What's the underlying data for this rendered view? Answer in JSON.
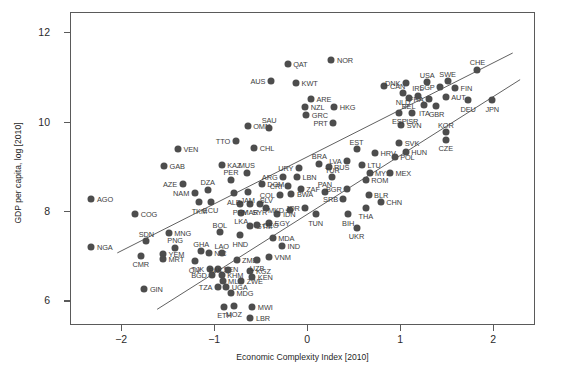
{
  "chart_data": {
    "type": "scatter",
    "title": "",
    "xlabel": "Economic Complexity Index [2010]",
    "ylabel": "GDP per capita, log [2010]",
    "xlim": [
      -2.55,
      2.45
    ],
    "ylim": [
      5.45,
      12.45
    ],
    "xticks": [
      -2,
      -1,
      0,
      1,
      2
    ],
    "xticklabels": [
      "−2",
      "−1",
      "0",
      "1",
      "2"
    ],
    "yticks": [
      6,
      8,
      10,
      12
    ],
    "yticklabels": [
      "6",
      "8",
      "10",
      "12"
    ],
    "grid": false,
    "legend": null,
    "marker_color": "#4d4d4d",
    "line_color": "#4d4d4d",
    "frame_color": "#5a5a5a",
    "trend_lines": [
      {
        "name": "upper-fit",
        "x1": -2.05,
        "y1": 7.05,
        "x2": 2.22,
        "y2": 11.55
      },
      {
        "name": "lower-fit",
        "x1": -1.62,
        "y1": 5.78,
        "x2": 2.3,
        "y2": 10.95
      }
    ],
    "points": [
      {
        "code": "AGO",
        "x": -2.33,
        "y": 8.28,
        "lp": "right"
      },
      {
        "code": "NGA",
        "x": -2.33,
        "y": 7.22,
        "lp": "right"
      },
      {
        "code": "COG",
        "x": -1.86,
        "y": 7.95,
        "lp": "right"
      },
      {
        "code": "SDN",
        "x": -1.74,
        "y": 7.35,
        "lp": "above"
      },
      {
        "code": "CMR",
        "x": -1.8,
        "y": 7.02,
        "lp": "below"
      },
      {
        "code": "GIN",
        "x": -1.76,
        "y": 6.28,
        "lp": "right"
      },
      {
        "code": "YEM",
        "x": -1.56,
        "y": 7.05,
        "lp": "right"
      },
      {
        "code": "MRT",
        "x": -1.56,
        "y": 6.95,
        "lp": "right"
      },
      {
        "code": "MNG",
        "x": -1.5,
        "y": 7.52,
        "lp": "right"
      },
      {
        "code": "PNG",
        "x": -1.43,
        "y": 7.2,
        "lp": "above"
      },
      {
        "code": "GAB",
        "x": -1.55,
        "y": 9.02,
        "lp": "right"
      },
      {
        "code": "VEN",
        "x": -1.4,
        "y": 9.4,
        "lp": "right"
      },
      {
        "code": "AZE",
        "x": -1.35,
        "y": 8.62,
        "lp": "left"
      },
      {
        "code": "NAM",
        "x": -1.22,
        "y": 8.42,
        "lp": "left"
      },
      {
        "code": "TKM",
        "x": -1.17,
        "y": 8.22,
        "lp": "below"
      },
      {
        "code": "ECU",
        "x": -1.05,
        "y": 8.23,
        "lp": "below"
      },
      {
        "code": "CIV",
        "x": -1.22,
        "y": 6.9,
        "lp": "below"
      },
      {
        "code": "GHA",
        "x": -1.15,
        "y": 7.12,
        "lp": "above"
      },
      {
        "code": "NIC",
        "x": -1.07,
        "y": 7.08,
        "lp": "right"
      },
      {
        "code": "BOL",
        "x": -0.95,
        "y": 7.55,
        "lp": "above"
      },
      {
        "code": "LAO",
        "x": -0.93,
        "y": 7.08,
        "lp": "above"
      },
      {
        "code": "TJK",
        "x": -1.06,
        "y": 6.72,
        "lp": "left"
      },
      {
        "code": "SEN",
        "x": -0.97,
        "y": 6.72,
        "lp": "right"
      },
      {
        "code": "BGD",
        "x": -1.03,
        "y": 6.58,
        "lp": "left"
      },
      {
        "code": "KHM",
        "x": -0.93,
        "y": 6.58,
        "lp": "right"
      },
      {
        "code": "PAK",
        "x": -0.86,
        "y": 6.7,
        "lp": "left"
      },
      {
        "code": "MLI",
        "x": -0.92,
        "y": 6.45,
        "lp": "right"
      },
      {
        "code": "TZA",
        "x": -0.97,
        "y": 6.33,
        "lp": "left"
      },
      {
        "code": "UGA",
        "x": -0.88,
        "y": 6.32,
        "lp": "right"
      },
      {
        "code": "MDG",
        "x": -0.83,
        "y": 6.18,
        "lp": "right"
      },
      {
        "code": "ETH",
        "x": -0.9,
        "y": 5.88,
        "lp": "below"
      },
      {
        "code": "MOZ",
        "x": -0.8,
        "y": 5.9,
        "lp": "below"
      },
      {
        "code": "MWI",
        "x": -0.6,
        "y": 5.88,
        "lp": "right"
      },
      {
        "code": "LBR",
        "x": -0.62,
        "y": 5.62,
        "lp": "right"
      },
      {
        "code": "ZWE",
        "x": -0.72,
        "y": 6.45,
        "lp": "right"
      },
      {
        "code": "ZMB",
        "x": -0.77,
        "y": 6.92,
        "lp": "right"
      },
      {
        "code": "KGZ",
        "x": -0.62,
        "y": 6.68,
        "lp": "right"
      },
      {
        "code": "KEN",
        "x": -0.6,
        "y": 6.55,
        "lp": "right"
      },
      {
        "code": "UZB",
        "x": -0.55,
        "y": 6.93,
        "lp": "below"
      },
      {
        "code": "VNM",
        "x": -0.42,
        "y": 7.0,
        "lp": "right"
      },
      {
        "code": "MDA",
        "x": -0.38,
        "y": 7.42,
        "lp": "right"
      },
      {
        "code": "IND",
        "x": -0.28,
        "y": 7.25,
        "lp": "right"
      },
      {
        "code": "EGY",
        "x": -0.42,
        "y": 7.75,
        "lp": "right"
      },
      {
        "code": "GTM",
        "x": -0.62,
        "y": 7.68,
        "lp": "right"
      },
      {
        "code": "GEO",
        "x": -0.55,
        "y": 7.7,
        "lp": "right"
      },
      {
        "code": "HND",
        "x": -0.73,
        "y": 7.48,
        "lp": "below"
      },
      {
        "code": "LKA",
        "x": -0.72,
        "y": 7.98,
        "lp": "below"
      },
      {
        "code": "PRY",
        "x": -0.73,
        "y": 8.18,
        "lp": "below"
      },
      {
        "code": "MAR",
        "x": -0.62,
        "y": 8.18,
        "lp": "below"
      },
      {
        "code": "SYR",
        "x": -0.52,
        "y": 8.18,
        "lp": "below"
      },
      {
        "code": "ALB",
        "x": -0.8,
        "y": 8.42,
        "lp": "below"
      },
      {
        "code": "JAM",
        "x": -0.65,
        "y": 8.45,
        "lp": "below"
      },
      {
        "code": "DZA",
        "x": -1.08,
        "y": 8.5,
        "lp": "above"
      },
      {
        "code": "PER",
        "x": -0.83,
        "y": 8.72,
        "lp": "above"
      },
      {
        "code": "MUS",
        "x": -0.66,
        "y": 8.88,
        "lp": "above"
      },
      {
        "code": "DOM",
        "x": -0.5,
        "y": 8.62,
        "lp": "right"
      },
      {
        "code": "KAZ",
        "x": -0.93,
        "y": 9.05,
        "lp": "right"
      },
      {
        "code": "TTO",
        "x": -0.78,
        "y": 9.58,
        "lp": "left"
      },
      {
        "code": "CHL",
        "x": -0.58,
        "y": 9.42,
        "lp": "right"
      },
      {
        "code": "OMN",
        "x": -0.65,
        "y": 9.92,
        "lp": "right"
      },
      {
        "code": "SAU",
        "x": -0.42,
        "y": 9.88,
        "lp": "above"
      },
      {
        "code": "AUS",
        "x": -0.4,
        "y": 10.92,
        "lp": "left"
      },
      {
        "code": "QAT",
        "x": -0.22,
        "y": 11.32,
        "lp": "right"
      },
      {
        "code": "KWT",
        "x": -0.13,
        "y": 10.88,
        "lp": "right"
      },
      {
        "code": "ARE",
        "x": 0.03,
        "y": 10.52,
        "lp": "right"
      },
      {
        "code": "NZL",
        "x": -0.03,
        "y": 10.35,
        "lp": "right"
      },
      {
        "code": "GRC",
        "x": -0.02,
        "y": 10.18,
        "lp": "right"
      },
      {
        "code": "HKG",
        "x": 0.28,
        "y": 10.35,
        "lp": "right"
      },
      {
        "code": "NOR",
        "x": 0.25,
        "y": 11.4,
        "lp": "right"
      },
      {
        "code": "PRT",
        "x": 0.27,
        "y": 9.98,
        "lp": "left"
      },
      {
        "code": "SLV",
        "x": -0.45,
        "y": 8.1,
        "lp": "above"
      },
      {
        "code": "IDN",
        "x": -0.33,
        "y": 7.95,
        "lp": "right"
      },
      {
        "code": "MKD",
        "x": -0.2,
        "y": 8.05,
        "lp": "left"
      },
      {
        "code": "JOR",
        "x": -0.03,
        "y": 8.08,
        "lp": "left"
      },
      {
        "code": "TUN",
        "x": 0.08,
        "y": 7.95,
        "lp": "below"
      },
      {
        "code": "COL",
        "x": -0.3,
        "y": 8.38,
        "lp": "left"
      },
      {
        "code": "BWA",
        "x": -0.18,
        "y": 8.4,
        "lp": "right"
      },
      {
        "code": "CRI",
        "x": -0.22,
        "y": 8.58,
        "lp": "left"
      },
      {
        "code": "ZAF",
        "x": -0.08,
        "y": 8.52,
        "lp": "right"
      },
      {
        "code": "ARG",
        "x": -0.27,
        "y": 8.78,
        "lp": "left"
      },
      {
        "code": "LBN",
        "x": -0.12,
        "y": 8.78,
        "lp": "right"
      },
      {
        "code": "URY",
        "x": -0.1,
        "y": 8.98,
        "lp": "left"
      },
      {
        "code": "BRA",
        "x": 0.12,
        "y": 9.08,
        "lp": "above"
      },
      {
        "code": "RUS",
        "x": 0.22,
        "y": 9.0,
        "lp": "right"
      },
      {
        "code": "TUR",
        "x": 0.26,
        "y": 8.78,
        "lp": "above"
      },
      {
        "code": "PAN",
        "x": 0.18,
        "y": 8.45,
        "lp": "above"
      },
      {
        "code": "BGR",
        "x": 0.42,
        "y": 8.52,
        "lp": "left"
      },
      {
        "code": "SRB",
        "x": 0.38,
        "y": 8.28,
        "lp": "left"
      },
      {
        "code": "BIH",
        "x": 0.43,
        "y": 7.95,
        "lp": "below"
      },
      {
        "code": "THA",
        "x": 0.62,
        "y": 8.1,
        "lp": "below"
      },
      {
        "code": "UKR",
        "x": 0.52,
        "y": 7.65,
        "lp": "below"
      },
      {
        "code": "BLR",
        "x": 0.65,
        "y": 8.38,
        "lp": "right"
      },
      {
        "code": "CHN",
        "x": 0.78,
        "y": 8.22,
        "lp": "right"
      },
      {
        "code": "ROM",
        "x": 0.62,
        "y": 8.72,
        "lp": "right"
      },
      {
        "code": "MYS",
        "x": 0.66,
        "y": 8.88,
        "lp": "right"
      },
      {
        "code": "MEX",
        "x": 0.88,
        "y": 8.88,
        "lp": "right"
      },
      {
        "code": "LVA",
        "x": 0.42,
        "y": 9.13,
        "lp": "left"
      },
      {
        "code": "LTU",
        "x": 0.58,
        "y": 9.05,
        "lp": "right"
      },
      {
        "code": "EST",
        "x": 0.52,
        "y": 9.4,
        "lp": "above"
      },
      {
        "code": "HRV",
        "x": 0.72,
        "y": 9.32,
        "lp": "right"
      },
      {
        "code": "POL",
        "x": 0.93,
        "y": 9.22,
        "lp": "right"
      },
      {
        "code": "SVK",
        "x": 0.98,
        "y": 9.55,
        "lp": "right"
      },
      {
        "code": "HUN",
        "x": 1.05,
        "y": 9.35,
        "lp": "right"
      },
      {
        "code": "CZE",
        "x": 1.48,
        "y": 9.62,
        "lp": "below"
      },
      {
        "code": "KOR",
        "x": 1.48,
        "y": 9.78,
        "lp": "above"
      },
      {
        "code": "SVN",
        "x": 1.0,
        "y": 9.95,
        "lp": "right"
      },
      {
        "code": "ESP",
        "x": 0.98,
        "y": 10.22,
        "lp": "below"
      },
      {
        "code": "ISR",
        "x": 1.12,
        "y": 10.22,
        "lp": "below"
      },
      {
        "code": "ITA",
        "x": 1.25,
        "y": 10.4,
        "lp": "below"
      },
      {
        "code": "GBR",
        "x": 1.38,
        "y": 10.38,
        "lp": "below"
      },
      {
        "code": "FRA",
        "x": 1.3,
        "y": 10.52,
        "lp": "left"
      },
      {
        "code": "BEL",
        "x": 1.08,
        "y": 10.55,
        "lp": "below"
      },
      {
        "code": "NLD",
        "x": 1.02,
        "y": 10.65,
        "lp": "below"
      },
      {
        "code": "IRL",
        "x": 1.18,
        "y": 10.6,
        "lp": "above"
      },
      {
        "code": "AUT",
        "x": 1.48,
        "y": 10.58,
        "lp": "right"
      },
      {
        "code": "DEU",
        "x": 1.72,
        "y": 10.5,
        "lp": "below"
      },
      {
        "code": "JPN",
        "x": 1.98,
        "y": 10.5,
        "lp": "below"
      },
      {
        "code": "CAN",
        "x": 0.82,
        "y": 10.82,
        "lp": "right"
      },
      {
        "code": "DNK",
        "x": 1.05,
        "y": 10.88,
        "lp": "left"
      },
      {
        "code": "USA",
        "x": 1.28,
        "y": 10.9,
        "lp": "above"
      },
      {
        "code": "SWE",
        "x": 1.5,
        "y": 10.92,
        "lp": "above"
      },
      {
        "code": "SGP",
        "x": 1.42,
        "y": 10.8,
        "lp": "left"
      },
      {
        "code": "FIN",
        "x": 1.58,
        "y": 10.78,
        "lp": "right"
      },
      {
        "code": "CHE",
        "x": 1.82,
        "y": 11.18,
        "lp": "above"
      }
    ]
  },
  "axes": {
    "x_title": "Economic Complexity Index [2010]",
    "y_title": "GDP per capita, log [2010]"
  }
}
